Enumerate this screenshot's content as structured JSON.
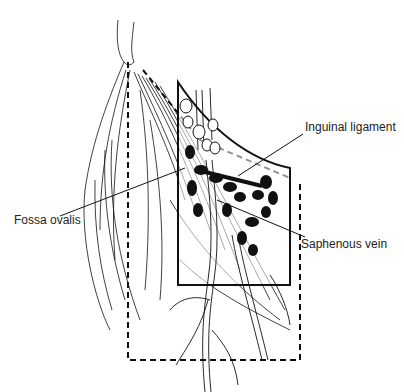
{
  "figure": {
    "labels": {
      "inguinal_ligament": "Inguinal ligament",
      "fossa_ovalis": "Fossa ovalis",
      "saphenous_vein": "Saphenous vein"
    },
    "colors": {
      "line": "#111111",
      "node_fill": "#111111",
      "background": "#ffffff"
    }
  }
}
